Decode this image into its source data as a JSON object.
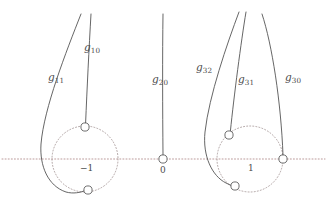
{
  "figure": {
    "width": 327,
    "height": 208,
    "background": "#ffffff",
    "curve_color": "#555555",
    "axis_color": "#b08a8a",
    "circle_color": "#9d8d8d",
    "label_color": "#4a4a4a"
  },
  "axis": {
    "name": "real-axis",
    "y": 159,
    "x_start": 2,
    "x_end": 325,
    "style": "dotted"
  },
  "points": [
    {
      "id": "minus-one",
      "label": "−1",
      "x": 85,
      "y": 159,
      "label_x": 80,
      "label_y": 164
    },
    {
      "id": "zero",
      "label": "0",
      "x": 163,
      "y": 159,
      "label_x": 160,
      "label_y": 166
    },
    {
      "id": "one",
      "label": "1",
      "x": 250,
      "y": 159,
      "label_x": 248,
      "label_y": 164
    }
  ],
  "circles": [
    {
      "id": "circle-minus-one",
      "cx": 85,
      "cy": 159,
      "r": 33
    },
    {
      "id": "circle-one",
      "cx": 250,
      "cy": 159,
      "r": 33
    }
  ],
  "curve_labels": [
    {
      "id": "g11",
      "base": "g",
      "sub": "11",
      "x": 48,
      "y": 72
    },
    {
      "id": "g10",
      "base": "g",
      "sub": "10",
      "x": 84,
      "y": 42
    },
    {
      "id": "g20",
      "base": "g",
      "sub": "20",
      "x": 152,
      "y": 74
    },
    {
      "id": "g32",
      "base": "g",
      "sub": "32",
      "x": 196,
      "y": 62
    },
    {
      "id": "g31",
      "base": "g",
      "sub": "31",
      "x": 238,
      "y": 74
    },
    {
      "id": "g30",
      "base": "g",
      "sub": "30",
      "x": 285,
      "y": 72
    }
  ],
  "markers": [
    {
      "id": "marker-g10-end",
      "cx": 85,
      "cy": 127,
      "r": 4.1
    },
    {
      "id": "marker-g11-end",
      "cx": 88,
      "cy": 190,
      "r": 4.1
    },
    {
      "id": "marker-zero",
      "cx": 163,
      "cy": 159,
      "r": 4.1
    },
    {
      "id": "marker-g31-end",
      "cx": 229,
      "cy": 135,
      "r": 4.1
    },
    {
      "id": "marker-g32-end",
      "cx": 235,
      "cy": 186,
      "r": 4.1
    },
    {
      "id": "marker-g30-end",
      "cx": 283,
      "cy": 159,
      "r": 4.1
    }
  ],
  "curves": [
    {
      "id": "g10",
      "path": "M 91 14 C 89 48, 87 90, 85.6 122.9"
    },
    {
      "id": "g11",
      "path": "M 81 14 C 66 52, 44 108, 41 144 C 39.5 166, 48 186, 66 192 C 73 194, 81 192.5, 84.2 190.8"
    },
    {
      "id": "g20",
      "path": "M 163 14 C 162.4 54, 162.6 110, 163 154.9"
    },
    {
      "id": "g32",
      "path": "M 239 12 C 227 44, 209 96, 205 132 C 202.5 156, 212 176, 226 183 C 229 184.5, 231.5 185.6, 233.2 186.2"
    },
    {
      "id": "g31",
      "path": "M 246 12 C 241 42, 234 96, 230.4 131"
    },
    {
      "id": "g30",
      "path": "M 262 14 C 272 44, 281 102, 283 155"
    }
  ]
}
